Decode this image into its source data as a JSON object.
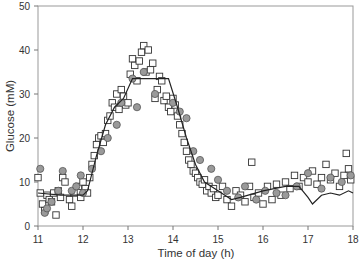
{
  "chart_data": {
    "type": "scatter",
    "title": "",
    "xlabel": "Time of day (h)",
    "ylabel": "Glucose (mM)",
    "xlim": [
      11,
      18
    ],
    "ylim": [
      0,
      50
    ],
    "xticks": [
      11,
      12,
      13,
      14,
      15,
      16,
      17,
      18
    ],
    "yticks": [
      0,
      10,
      20,
      30,
      40,
      50
    ],
    "grid": false,
    "legend": null,
    "series": [
      {
        "name": "model",
        "kind": "line",
        "color": "#222222",
        "x": [
          11.0,
          11.5,
          12.0,
          12.1,
          12.3,
          12.5,
          12.7,
          12.9,
          13.1,
          13.9,
          14.1,
          14.3,
          14.5,
          14.7,
          15.0,
          15.3,
          15.5,
          16.0,
          16.5,
          16.8,
          17.0,
          17.1,
          17.3,
          17.5,
          17.7,
          17.9,
          18.0
        ],
        "y": [
          7.5,
          7.0,
          7.0,
          8.0,
          16.0,
          23.0,
          27.0,
          29.0,
          33.5,
          33.5,
          27.0,
          20.0,
          14.0,
          10.0,
          8.0,
          6.0,
          6.5,
          8.0,
          9.0,
          9.0,
          6.5,
          5.0,
          7.0,
          7.5,
          7.0,
          8.0,
          7.5
        ]
      },
      {
        "name": "open squares",
        "kind": "scatter",
        "marker": "square",
        "color": "#333333",
        "fill": "#ffffff",
        "x": [
          11.0,
          11.05,
          11.1,
          11.15,
          11.2,
          11.25,
          11.3,
          11.35,
          11.4,
          11.45,
          11.5,
          11.55,
          11.6,
          11.7,
          11.75,
          11.8,
          11.9,
          11.95,
          12.0,
          12.05,
          12.1,
          12.15,
          12.2,
          12.25,
          12.3,
          12.35,
          12.4,
          12.45,
          12.5,
          12.55,
          12.6,
          12.65,
          12.7,
          12.75,
          12.8,
          12.85,
          12.9,
          12.95,
          13.0,
          13.05,
          13.1,
          13.15,
          13.2,
          13.25,
          13.3,
          13.35,
          13.4,
          13.45,
          13.5,
          13.55,
          13.6,
          13.65,
          13.7,
          13.75,
          13.8,
          13.85,
          13.9,
          13.95,
          14.0,
          14.05,
          14.1,
          14.15,
          14.2,
          14.25,
          14.3,
          14.35,
          14.4,
          14.45,
          14.5,
          14.55,
          14.6,
          14.65,
          14.7,
          14.75,
          14.8,
          14.85,
          14.9,
          14.95,
          15.0,
          15.1,
          15.2,
          15.3,
          15.4,
          15.5,
          15.6,
          15.7,
          15.75,
          15.8,
          15.9,
          16.0,
          16.1,
          16.2,
          16.3,
          16.4,
          16.5,
          16.6,
          16.7,
          16.8,
          16.9,
          17.0,
          17.1,
          17.2,
          17.3,
          17.4,
          17.5,
          17.6,
          17.7,
          17.8,
          17.85,
          17.9,
          17.95
        ],
        "y": [
          11.0,
          7.5,
          5.0,
          3.5,
          7.0,
          6.0,
          5.5,
          7.5,
          2.5,
          8.0,
          6.5,
          11.0,
          10.0,
          6.0,
          4.5,
          7.5,
          9.0,
          6.5,
          10.0,
          8.5,
          7.5,
          11.0,
          14.0,
          16.0,
          18.5,
          20.0,
          20.5,
          19.0,
          21.0,
          24.0,
          25.0,
          28.0,
          27.0,
          30.0,
          26.5,
          31.0,
          29.5,
          27.5,
          28.0,
          34.5,
          38.0,
          36.5,
          33.0,
          37.5,
          39.5,
          41.0,
          35.0,
          40.0,
          35.5,
          37.0,
          29.0,
          31.0,
          34.0,
          33.0,
          28.5,
          29.5,
          27.0,
          26.0,
          29.0,
          27.5,
          25.0,
          23.0,
          21.0,
          19.0,
          17.0,
          15.0,
          14.0,
          12.5,
          12.0,
          11.0,
          10.0,
          9.5,
          10.5,
          8.0,
          9.0,
          7.5,
          8.5,
          6.5,
          7.0,
          9.0,
          6.0,
          4.5,
          8.0,
          7.0,
          5.5,
          9.0,
          14.5,
          6.5,
          7.5,
          5.0,
          9.0,
          6.0,
          9.5,
          7.0,
          10.0,
          8.5,
          11.5,
          9.0,
          11.0,
          10.0,
          12.5,
          9.5,
          11.0,
          14.0,
          10.5,
          12.0,
          9.0,
          11.5,
          16.5,
          13.0,
          10.5
        ]
      },
      {
        "name": "gray circles",
        "kind": "scatter",
        "marker": "circle",
        "color": "#555555",
        "fill": "#9a9a9a",
        "x": [
          11.05,
          11.15,
          11.2,
          11.3,
          11.45,
          11.55,
          11.75,
          11.85,
          11.95,
          12.0,
          12.2,
          12.4,
          12.55,
          12.75,
          12.85,
          13.1,
          13.2,
          13.35,
          13.6,
          14.0,
          14.15,
          14.3,
          14.45,
          14.6,
          14.85,
          15.0,
          15.2,
          15.45,
          15.6,
          15.85,
          16.05,
          16.3,
          16.5,
          16.75,
          17.0,
          17.3,
          17.5,
          17.75,
          17.95
        ],
        "y": [
          13.0,
          3.0,
          4.0,
          5.5,
          8.0,
          12.5,
          8.0,
          9.0,
          11.5,
          7.5,
          13.0,
          17.0,
          20.0,
          23.0,
          28.0,
          33.5,
          27.0,
          35.0,
          30.0,
          28.0,
          26.0,
          24.5,
          17.0,
          15.0,
          13.0,
          10.5,
          8.0,
          6.5,
          9.0,
          6.0,
          8.0,
          7.5,
          7.0,
          9.0,
          12.0,
          8.5,
          11.0,
          10.0,
          11.5
        ]
      }
    ]
  },
  "axes": {
    "xlabel": "Time of day (h)",
    "ylabel": "Glucose (mM)",
    "xticks": [
      "11",
      "12",
      "13",
      "14",
      "15",
      "16",
      "17",
      "18"
    ],
    "yticks": [
      "0",
      "10",
      "20",
      "30",
      "40",
      "50"
    ]
  }
}
